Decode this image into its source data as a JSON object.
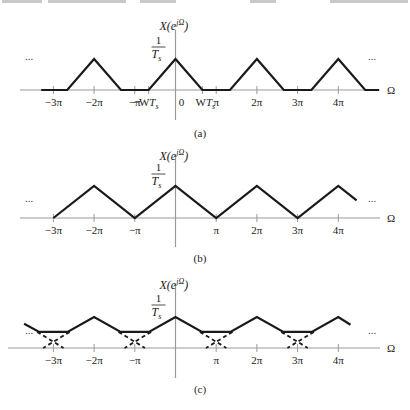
{
  "figure": {
    "panels": [
      {
        "id": "a",
        "caption": "(a)",
        "y_label": "X(e^{jΩ})",
        "y_label_base": "X(e",
        "y_label_sup": "jΩ",
        "y_label_close": ")",
        "peak_label_num": "1",
        "peak_label_den": "T",
        "peak_label_den_sub": "s",
        "x_label": "Ω",
        "ellipsis_left": "...",
        "ellipsis_right": "...",
        "tick_labels": [
          "−3π",
          "−2π",
          "−π",
          "−WT",
          "0",
          "WT",
          "π",
          "2π",
          "3π",
          "4π"
        ]
      },
      {
        "id": "b",
        "caption": "(b)",
        "y_label_base": "X(e",
        "y_label_sup": "jΩ",
        "y_label_close": ")",
        "peak_label_num": "1",
        "peak_label_den": "T",
        "peak_label_den_sub": "s",
        "x_label": "Ω",
        "ellipsis_left": "...",
        "ellipsis_right": "...",
        "tick_labels": [
          "−3π",
          "−2π",
          "−π",
          "π",
          "2π",
          "3π",
          "4π"
        ]
      },
      {
        "id": "c",
        "caption": "(c)",
        "y_label_base": "X(e",
        "y_label_sup": "jΩ",
        "y_label_close": ")",
        "peak_label_num": "1",
        "peak_label_den": "T",
        "peak_label_den_sub": "s",
        "x_label": "Ω",
        "ellipsis_left": "...",
        "ellipsis_right": "...",
        "tick_labels": [
          "−3π",
          "−2π",
          "−π",
          "π",
          "2π",
          "3π",
          "4π"
        ]
      }
    ]
  },
  "chart_data": [
    {
      "type": "line",
      "title": "(a) Sampled spectrum, no aliasing (W·Ts < π)",
      "xlabel": "Ω",
      "ylabel": "X(e^{jΩ})",
      "x_ticks": [
        "−3π",
        "−2π",
        "−π",
        "−WTs",
        "0",
        "WTs",
        "π",
        "2π",
        "3π",
        "4π"
      ],
      "x_tick_values_pi": [
        -3,
        -2,
        -1,
        -0.66,
        0,
        0.66,
        1,
        2,
        3,
        4
      ],
      "y_ticks": [
        "1/Ts"
      ],
      "peak_value": "1/Ts",
      "triangle_half_width_pi": 0.66,
      "peak_positions_pi": [
        -2,
        0,
        2,
        4
      ],
      "series": [
        {
          "name": "X(e^{jΩ})",
          "x_pi": [
            -3.3,
            -2.66,
            -2,
            -1.34,
            -0.66,
            0,
            0.66,
            1.34,
            2,
            2.66,
            3.34,
            4,
            4.66,
            5.0
          ],
          "y": [
            0,
            0,
            1,
            0,
            0,
            1,
            0,
            0,
            1,
            0,
            0,
            1,
            0,
            0
          ]
        }
      ],
      "xlim_pi": [
        -3.5,
        5.2
      ],
      "ylim": [
        0,
        1.1
      ],
      "grid": false,
      "legend": "none"
    },
    {
      "type": "line",
      "title": "(b) Sampled spectrum, W·Ts = π (triangles touch)",
      "xlabel": "Ω",
      "ylabel": "X(e^{jΩ})",
      "x_ticks": [
        "−3π",
        "−2π",
        "−π",
        "π",
        "2π",
        "3π",
        "4π"
      ],
      "x_tick_values_pi": [
        -3,
        -2,
        -1,
        1,
        2,
        3,
        4
      ],
      "y_ticks": [
        "1/Ts"
      ],
      "peak_value": "1/Ts",
      "triangle_half_width_pi": 1.0,
      "series": [
        {
          "name": "X(e^{jΩ})",
          "x_pi": [
            -3,
            -2,
            -1,
            0,
            1,
            2,
            3,
            4,
            4.45
          ],
          "y": [
            0,
            1,
            0,
            1,
            0,
            1,
            0,
            1,
            0.55
          ]
        }
      ],
      "xlim_pi": [
        -3.5,
        5.2
      ],
      "ylim": [
        0,
        1.1
      ],
      "grid": false,
      "legend": "none"
    },
    {
      "type": "line",
      "title": "(c) Sampled spectrum with aliasing (W·Ts > π)",
      "xlabel": "Ω",
      "ylabel": "X(e^{jΩ})",
      "x_ticks": [
        "−3π",
        "−2π",
        "−π",
        "π",
        "2π",
        "3π",
        "4π"
      ],
      "x_tick_values_pi": [
        -3,
        -2,
        -1,
        1,
        2,
        3,
        4
      ],
      "y_ticks": [
        "1/Ts"
      ],
      "peak_value": "1/Ts",
      "triangle_half_width_pi": 1.25,
      "flat_level_fraction_of_peak": 0.52,
      "series": [
        {
          "name": "X(e^{jΩ}) (sum, solid)",
          "x_pi": [
            -3.72,
            -3.35,
            -2.65,
            -2,
            -1.35,
            -0.65,
            0,
            0.65,
            1.35,
            2,
            2.65,
            3.35,
            4,
            4.3
          ],
          "y": [
            0.78,
            0.52,
            0.52,
            1,
            0.52,
            0.52,
            1,
            0.52,
            0.52,
            1,
            0.52,
            0.52,
            1,
            0.75
          ]
        },
        {
          "name": "individual shifted replicas (dashed, overlap region)",
          "overlap_centers_pi": [
            -3,
            -1,
            1,
            3
          ],
          "crossing_y": 0.25
        }
      ],
      "xlim_pi": [
        -3.9,
        5.2
      ],
      "ylim": [
        0,
        1.1
      ],
      "grid": false,
      "legend": "none"
    }
  ]
}
